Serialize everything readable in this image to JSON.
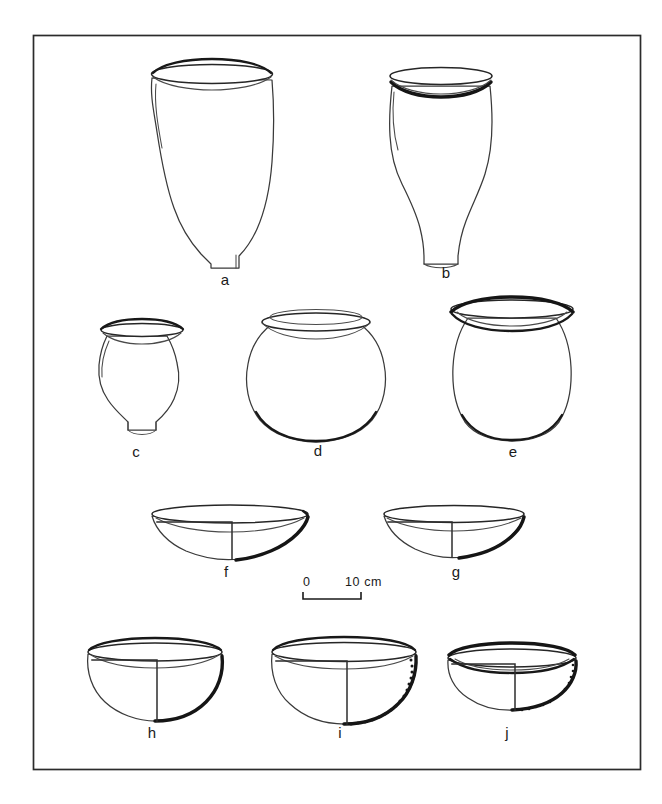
{
  "figure": {
    "kind": "archaeological-pottery-plate",
    "background_color": "#ffffff",
    "ink_color": "#1a1a1a",
    "frame": {
      "x": 33,
      "y": 35,
      "width": 608,
      "height": 735,
      "stroke": "#2b2b2b"
    }
  },
  "scale": {
    "zero_label": "0",
    "max_label": "10 cm",
    "units": "cm",
    "length_cm": 10
  },
  "vessels": [
    {
      "id": "a",
      "label": "a",
      "row": 1,
      "form": "deep conical jar",
      "description": "Deep jar with wide everted rim, rounded shoulder and conical lower body narrowing to a small flat base.",
      "label_x": 225,
      "label_y": 285
    },
    {
      "id": "b",
      "label": "b",
      "row": 1,
      "form": "ovoid jar",
      "description": "Ovoid jar with thick dark everted rim, bulging shoulder and tapering base.",
      "label_x": 446,
      "label_y": 278
    },
    {
      "id": "c",
      "label": "c",
      "row": 2,
      "form": "small globular jar",
      "description": "Small globular jar with flaring dark rim and slightly concave base.",
      "label_x": 136,
      "label_y": 457
    },
    {
      "id": "d",
      "label": "d",
      "row": 2,
      "form": "spherical globular jar",
      "description": "Spherical jar with wide mouth, double-line rim and rounded base.",
      "label_x": 318,
      "label_y": 456
    },
    {
      "id": "e",
      "label": "e",
      "row": 2,
      "form": "barrel-shaped jar",
      "description": "Barrel-shaped jar with very wide everted dark rim and flattened base.",
      "label_x": 513,
      "label_y": 457
    },
    {
      "id": "f",
      "label": "f",
      "row": 3,
      "form": "shallow open bowl",
      "description": "Shallow open bowl drawn in half section; thickened dark exterior base edge.",
      "label_x": 226,
      "label_y": 577
    },
    {
      "id": "g",
      "label": "g",
      "row": 3,
      "form": "shallow open bowl",
      "description": "Shallow open bowl drawn in half section, slightly smaller than f.",
      "label_x": 456,
      "label_y": 577
    },
    {
      "id": "h",
      "label": "h",
      "row": 4,
      "form": "deep hemispherical bowl",
      "description": "Deep hemispherical bowl in half section with heavy dark exterior edge.",
      "label_x": 152,
      "label_y": 738
    },
    {
      "id": "i",
      "label": "i",
      "row": 4,
      "form": "deep hemispherical bowl, decorated",
      "description": "Deep hemispherical bowl in half section with stippled / punctate decorated band on the lower right exterior.",
      "label_x": 340,
      "label_y": 738
    },
    {
      "id": "j",
      "label": "j",
      "row": 4,
      "form": "shallow bowl, decorated",
      "description": "Shallow bowl in half section with faint stippled decoration on the lower right exterior.",
      "label_x": 507,
      "label_y": 738
    }
  ]
}
